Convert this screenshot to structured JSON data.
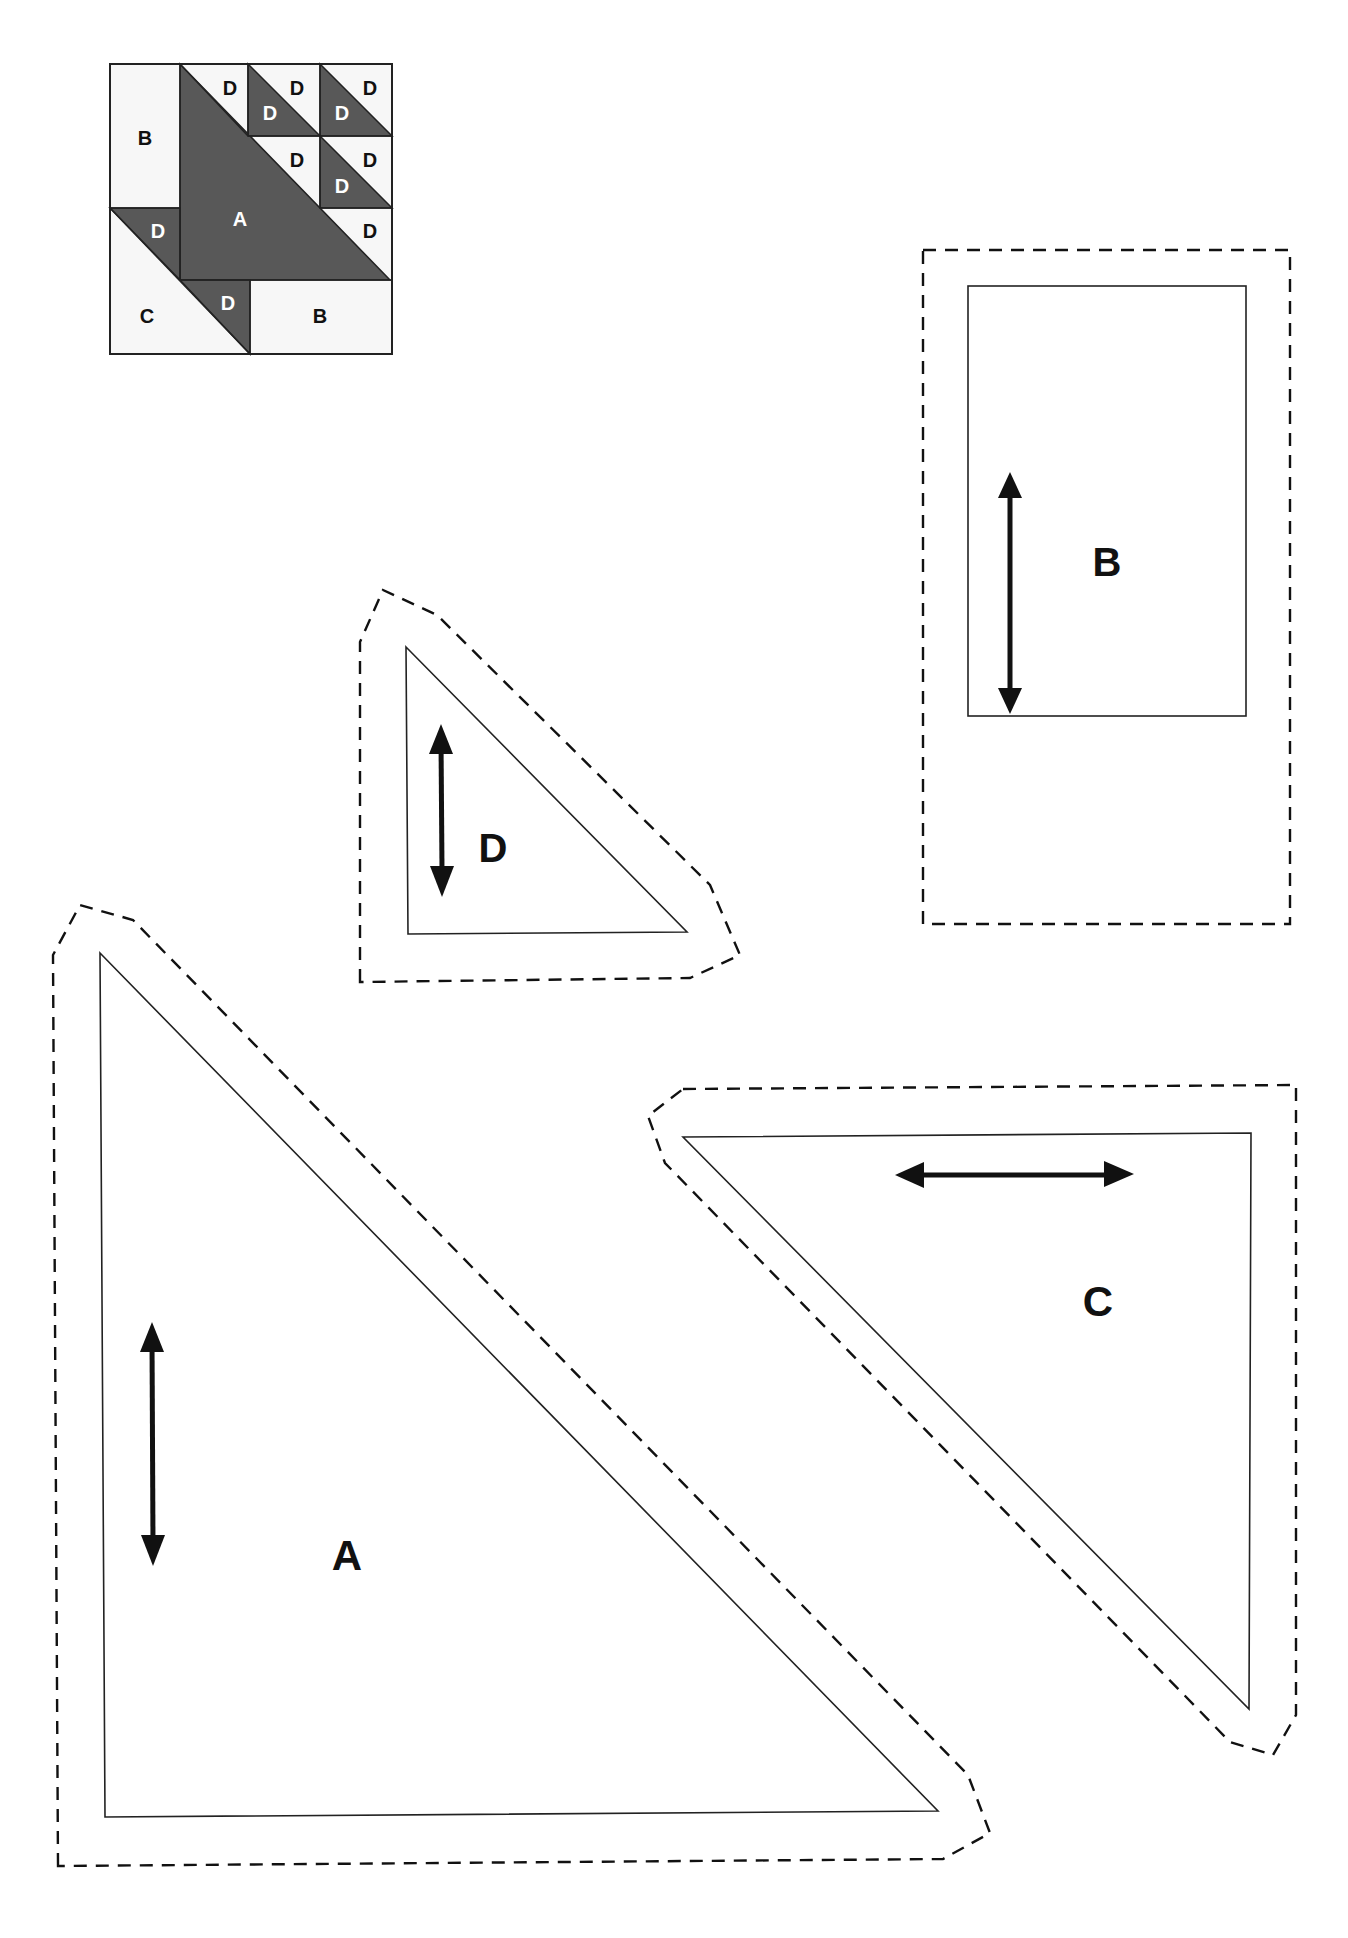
{
  "block_diagram": {
    "fill_dark": "#585858",
    "fill_light": "#f7f7f7",
    "labels": {
      "b_left": "B",
      "a": "A",
      "c": "C",
      "b_bottom": "B",
      "d_top1": "D",
      "d_top2": "D",
      "d_top2_dark": "D",
      "d_top3": "D",
      "d_top3_dark": "D",
      "d_mid2": "D",
      "d_mid3": "D",
      "d_mid3_dark": "D",
      "d_row3": "D",
      "d_left_dark": "D",
      "d_bottom_dark": "D"
    }
  },
  "templates": [
    {
      "id": "B",
      "label": "B",
      "shape": "rectangle",
      "grain": "vertical"
    },
    {
      "id": "D",
      "label": "D",
      "shape": "right-triangle",
      "grain": "vertical"
    },
    {
      "id": "A",
      "label": "A",
      "shape": "right-triangle",
      "grain": "vertical"
    },
    {
      "id": "C",
      "label": "C",
      "shape": "right-triangle",
      "grain": "horizontal"
    }
  ],
  "legend": {
    "cut_line": "solid",
    "seam_allowance": "dashed",
    "grain_arrow": "double-headed"
  }
}
